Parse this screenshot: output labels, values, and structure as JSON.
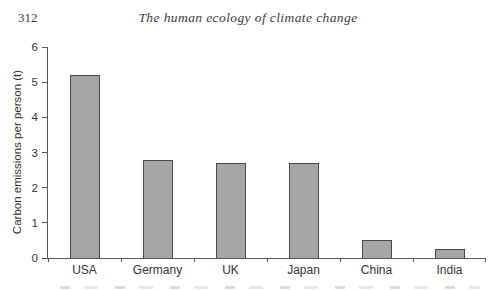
{
  "page": {
    "page_number": "312",
    "running_title": "The human ecology of climate change"
  },
  "chart_data": {
    "type": "bar",
    "categories": [
      "USA",
      "Germany",
      "UK",
      "Japan",
      "China",
      "India"
    ],
    "values": [
      5.2,
      2.8,
      2.7,
      2.7,
      0.5,
      0.25
    ],
    "title": "",
    "xlabel": "",
    "ylabel": "Carbon emissions per person (t)",
    "ylim": [
      0,
      6
    ],
    "ytick_step": 1,
    "yticks": [
      "0",
      "1",
      "2",
      "3",
      "4",
      "5",
      "6"
    ],
    "grid": false,
    "legend": "none",
    "bar_color": "#a6a6a6",
    "bar_border_color": "#4a4a4c",
    "axis_color": "#58585a",
    "text_color": "#353537"
  }
}
